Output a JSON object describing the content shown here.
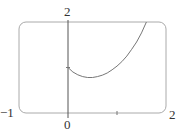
{
  "chart_data": {
    "type": "line",
    "title": "",
    "xlabel": "",
    "ylabel": "",
    "xlim": [
      -1,
      2
    ],
    "ylim": [
      0,
      2
    ],
    "grid": false,
    "x_tick_labels": [
      "-1",
      "0",
      "2"
    ],
    "y_tick_labels": [
      "2"
    ],
    "series": [
      {
        "name": "f(x)",
        "x": [
          0,
          0.1,
          0.2,
          0.3,
          0.4,
          0.5,
          0.6,
          0.7,
          0.8,
          0.9,
          1.0,
          1.1,
          1.2,
          1.3,
          1.4,
          1.5,
          1.6
        ],
        "y": [
          1.0,
          0.9,
          0.84,
          0.8,
          0.78,
          0.78,
          0.8,
          0.83,
          0.88,
          0.95,
          1.03,
          1.13,
          1.25,
          1.4,
          1.56,
          1.76,
          2.0
        ]
      }
    ]
  },
  "labels": {
    "y_top": "2",
    "x_left": "−1",
    "x_origin": "0",
    "x_right": "2"
  },
  "colors": {
    "frame": "#aaaaaa",
    "axis": "#555555",
    "curve": "#777777",
    "text": "#333333"
  }
}
